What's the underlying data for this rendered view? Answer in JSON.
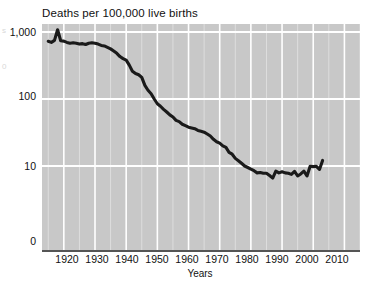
{
  "chart_data": {
    "type": "line",
    "title": "Deaths per 100,000 live births",
    "xlabel": "Years",
    "ylabel": "",
    "yscale": "log",
    "grid": true,
    "legend": null,
    "xlim": [
      1913,
      2015
    ],
    "ylim": [
      1,
      1400
    ],
    "xticks": [
      "1920",
      "1930",
      "1940",
      "1950",
      "1960",
      "1970",
      "1980",
      "1990",
      "2000",
      "2010"
    ],
    "xtick_values": [
      1920,
      1930,
      1940,
      1950,
      1960,
      1970,
      1980,
      1990,
      2000,
      2010
    ],
    "yticks": [
      "1,000",
      "100",
      "10",
      "0"
    ],
    "ytick_values": [
      1000,
      100,
      10,
      1
    ],
    "series": [
      {
        "name": "Maternal deaths per 100,000 live births",
        "color": "#1a1a1a",
        "x": [
          1915,
          1916,
          1917,
          1918,
          1919,
          1920,
          1921,
          1922,
          1923,
          1924,
          1925,
          1926,
          1927,
          1928,
          1929,
          1930,
          1931,
          1932,
          1933,
          1934,
          1935,
          1936,
          1937,
          1938,
          1939,
          1940,
          1941,
          1942,
          1943,
          1944,
          1945,
          1946,
          1947,
          1948,
          1949,
          1950,
          1951,
          1952,
          1953,
          1954,
          1955,
          1956,
          1957,
          1958,
          1959,
          1960,
          1961,
          1962,
          1963,
          1964,
          1965,
          1966,
          1967,
          1968,
          1969,
          1970,
          1971,
          1972,
          1973,
          1974,
          1975,
          1976,
          1977,
          1978,
          1979,
          1980,
          1981,
          1982,
          1983,
          1984,
          1985,
          1986,
          1987,
          1988,
          1989,
          1990,
          1991,
          1992,
          1993,
          1994,
          1995,
          1996,
          1997,
          1998,
          1999,
          2000,
          2001,
          2002,
          2003
        ],
        "y": [
          728,
          700,
          750,
          1080,
          740,
          730,
          700,
          680,
          690,
          680,
          660,
          670,
          650,
          680,
          690,
          680,
          660,
          630,
          620,
          590,
          560,
          520,
          480,
          430,
          400,
          380,
          320,
          260,
          240,
          230,
          210,
          160,
          135,
          120,
          100,
          85,
          78,
          70,
          64,
          58,
          54,
          48,
          46,
          42,
          40,
          38,
          37,
          36,
          34,
          33,
          32,
          30,
          28,
          25,
          23,
          22,
          20,
          19,
          16,
          15,
          13,
          12,
          11,
          10,
          9.5,
          9.0,
          8.5,
          7.9,
          8.0,
          7.8,
          7.8,
          7.2,
          6.6,
          8.4,
          7.9,
          8.2,
          7.9,
          7.8,
          7.5,
          8.3,
          7.1,
          7.6,
          8.4,
          7.1,
          9.9,
          9.8,
          9.9,
          8.9,
          12.1
        ],
        "annotations": [
          {
            "label": "1918 influenza pandemic spike",
            "x": 1918,
            "y": 1080
          }
        ]
      }
    ]
  },
  "axes": {
    "y_ticks": [
      {
        "label": "1,000",
        "top": 26
      },
      {
        "label": "100",
        "top": 90
      },
      {
        "label": "10",
        "top": 160
      },
      {
        "label": "0",
        "top": 235
      }
    ],
    "x_ticks": [
      {
        "label": "1920",
        "left": 47
      },
      {
        "label": "1930",
        "left": 77
      },
      {
        "label": "1940",
        "left": 107
      },
      {
        "label": "1950",
        "left": 137
      },
      {
        "label": "1960",
        "left": 167
      },
      {
        "label": "1970",
        "left": 197
      },
      {
        "label": "1980",
        "left": 227
      },
      {
        "label": "1990",
        "left": 257
      },
      {
        "label": "2000",
        "left": 287
      },
      {
        "label": "2010",
        "left": 317
      }
    ]
  },
  "margin_notes": {
    "ghost_a": "s",
    "ghost_b": "0"
  },
  "colors": {
    "plot_background": "#c8c8c8",
    "gridline": "#ffffff",
    "line": "#1a1a1a",
    "text": "#111111",
    "axis": "#555555"
  }
}
